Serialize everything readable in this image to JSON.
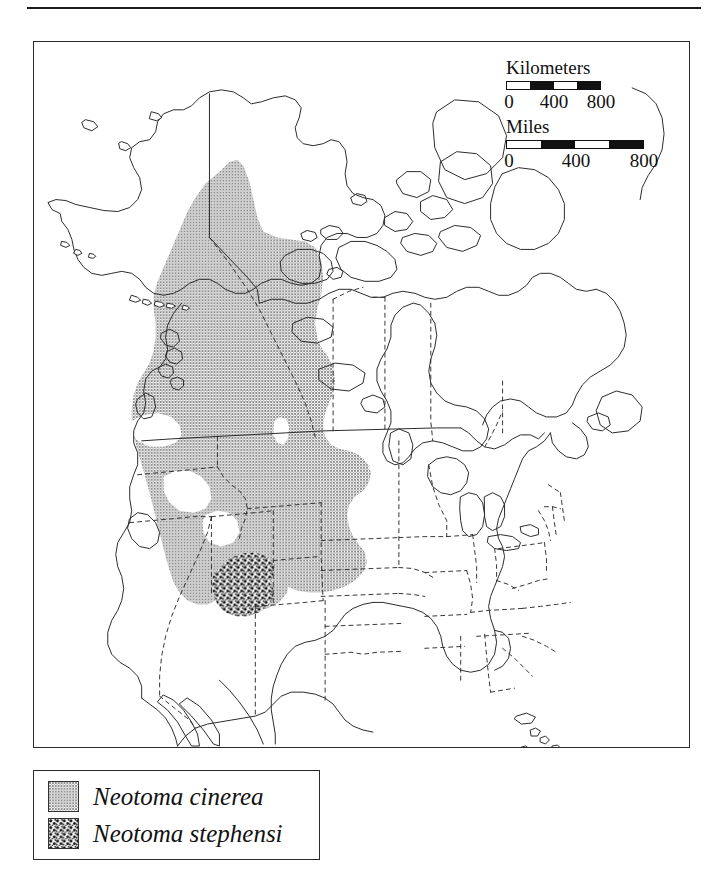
{
  "figure": {
    "type": "species-distribution-map",
    "region": "North America"
  },
  "scalebars": [
    {
      "name": "kilometers",
      "title": "Kilometers",
      "ticks": [
        "0",
        "400",
        "800"
      ],
      "segments": [
        "light",
        "dark",
        "light",
        "dark"
      ]
    },
    {
      "name": "miles",
      "title": "Miles",
      "ticks": [
        "0",
        "400",
        "800"
      ],
      "segments": [
        "light",
        "dark",
        "light",
        "dark"
      ]
    }
  ],
  "legend": {
    "items": [
      {
        "label": "Neotoma cinerea",
        "pattern": "solid-gray",
        "color": "#9a9a9a"
      },
      {
        "label": "Neotoma stephensi",
        "pattern": "coarse-stipple",
        "color": "#111111"
      }
    ]
  },
  "ranges": [
    {
      "species": "Neotoma cinerea",
      "fill": "gray-halftone",
      "description": "Intermountain West from southeastern Alaska and British Columbia south through the Rocky Mountains and Great Basin to Arizona and New Mexico"
    },
    {
      "species": "Neotoma stephensi",
      "fill": "black-stipple",
      "description": "Four Corners region of the Colorado Plateau in northern Arizona and New Mexico"
    }
  ],
  "colors": {
    "outline": "#2a2a2a",
    "range_cinerea": "#9a9a9a",
    "range_stephensi": "#111111",
    "background": "#ffffff"
  }
}
